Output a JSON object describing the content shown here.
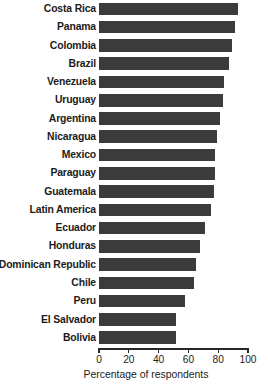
{
  "chart_data": {
    "type": "bar",
    "orientation": "horizontal",
    "title": "",
    "xlabel": "Percentage of respondents",
    "ylabel": "",
    "xlim": [
      0,
      100
    ],
    "xticks": [
      0,
      20,
      40,
      60,
      80,
      100
    ],
    "grid": false,
    "legend": null,
    "bar_color": "#3b3b3b",
    "categories": [
      "Costa Rica",
      "Panama",
      "Colombia",
      "Brazil",
      "Venezuela",
      "Uruguay",
      "Argentina",
      "Nicaragua",
      "Mexico",
      "Paraguay",
      "Guatemala",
      "Latin America",
      "Ecuador",
      "Honduras",
      "Dominican Republic",
      "Chile",
      "Peru",
      "El Salvador",
      "Bolivia"
    ],
    "values": [
      93,
      91,
      89,
      87,
      84,
      83,
      81,
      79,
      78,
      78,
      77,
      75,
      71,
      68,
      65,
      64,
      58,
      52,
      52
    ]
  }
}
